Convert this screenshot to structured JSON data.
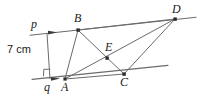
{
  "figure": {
    "type": "geometry-diagram",
    "background_color": "#ffffff",
    "line_color": "#6b6b6b",
    "vertex_color": "#2b2b2b",
    "label_color": "#1b1b1b"
  },
  "dimension": {
    "label": "7 cm",
    "value": 7,
    "unit": "cm",
    "description": "perpendicular distance between parallel lines p and q"
  },
  "lines": {
    "p": {
      "label": "p",
      "description": "upper parallel line through B and D",
      "x1": 30,
      "y1": 35,
      "x2": 196,
      "y2": 17,
      "arrow_at": {
        "x": 54,
        "y": 32
      }
    },
    "q": {
      "label": "q",
      "description": "lower parallel line through A and C",
      "x1": 32,
      "y1": 79,
      "x2": 168,
      "y2": 65,
      "arrow_at": {
        "x": 57,
        "y": 79
      }
    }
  },
  "points": [
    {
      "name": "A",
      "label": "A",
      "x": 65,
      "y": 79
    },
    {
      "name": "B",
      "label": "B",
      "x": 78,
      "y": 30
    },
    {
      "name": "C",
      "label": "C",
      "x": 124,
      "y": 74
    },
    {
      "name": "D",
      "label": "D",
      "x": 175,
      "y": 19
    },
    {
      "name": "E",
      "label": "E",
      "x": 107,
      "y": 58
    },
    {
      "name": "q",
      "label": "q",
      "x": 50,
      "y": 79
    },
    {
      "name": "p",
      "label": "p",
      "x": 47,
      "y": 33
    }
  ],
  "segments": [
    {
      "name": "A-B",
      "from": "A",
      "to": "B"
    },
    {
      "name": "B-D",
      "from": "B",
      "to": "D"
    },
    {
      "name": "B-C",
      "from": "B",
      "to": "C"
    },
    {
      "name": "A-D",
      "from": "A",
      "to": "D"
    },
    {
      "name": "C-D",
      "from": "C",
      "to": "D"
    },
    {
      "name": "A-C",
      "from": "A",
      "to": "C"
    },
    {
      "name": "p-q",
      "from": "p",
      "to": "q"
    }
  ],
  "markers": {
    "right_angle": {
      "name": "right-angle-at-q",
      "x": 44,
      "y": 69,
      "size": 7
    }
  }
}
